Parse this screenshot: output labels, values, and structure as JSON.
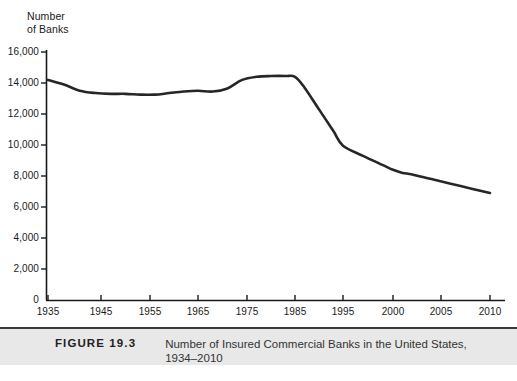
{
  "figure": {
    "number_label": "FIGURE 19.3",
    "caption": "Number of Insured Commercial Banks in the United States, 1934–2010"
  },
  "chart_data": {
    "type": "line",
    "title": "",
    "axis_title_line1": "Number",
    "axis_title_line2": "of Banks",
    "ylabel": "Number of Banks",
    "xlabel": "",
    "ylim": [
      0,
      16000
    ],
    "yticks": [
      0,
      2000,
      4000,
      6000,
      8000,
      10000,
      12000,
      14000,
      16000
    ],
    "ytick_labels": [
      "0",
      "2,000",
      "4,000",
      "6,000",
      "8,000",
      "10,000",
      "12,000",
      "14,000",
      "16,000"
    ],
    "xlim": [
      1935,
      2012
    ],
    "xticks": [
      1935,
      1945,
      1955,
      1965,
      1975,
      1985,
      1995,
      2000,
      2005,
      2010
    ],
    "xtick_labels": [
      "1935",
      "1945",
      "1955",
      "1965",
      "1975",
      "1985",
      "1995",
      "2000",
      "2005",
      "2010"
    ],
    "grid": false,
    "legend": "none",
    "line_color": "#262626",
    "line_width_px": 2.6,
    "series": [
      {
        "name": "Number of insured commercial banks",
        "x": [
          1935,
          1938,
          1941,
          1944,
          1947,
          1950,
          1953,
          1956,
          1959,
          1962,
          1965,
          1968,
          1971,
          1974,
          1977,
          1980,
          1983,
          1985,
          1987,
          1990,
          1993,
          1995,
          1997,
          1999,
          2000,
          2001,
          2002,
          2004,
          2007,
          2010
        ],
        "values": [
          14200,
          13900,
          13500,
          13350,
          13300,
          13300,
          13250,
          13250,
          13350,
          13450,
          13500,
          13450,
          13650,
          14200,
          14400,
          14450,
          14450,
          14400,
          13700,
          12300,
          10900,
          9950,
          9300,
          8700,
          8400,
          8200,
          8100,
          7800,
          7350,
          6900
        ]
      }
    ],
    "annotations": []
  }
}
